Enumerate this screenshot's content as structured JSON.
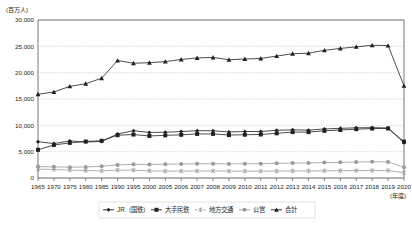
{
  "chart_data": {
    "type": "line",
    "title": "",
    "ylabel": "(百万人)",
    "xlabel": "(年度)",
    "ylim": [
      0,
      30000
    ],
    "yticks": [
      "0",
      "5,000",
      "10,000",
      "15,000",
      "20,000",
      "25,000",
      "30,000"
    ],
    "ytick_values": [
      0,
      5000,
      10000,
      15000,
      20000,
      25000,
      30000
    ],
    "grid": true,
    "legend_position": "bottom",
    "categories": [
      "1965",
      "1970",
      "1975",
      "1980",
      "1985",
      "1990",
      "1995",
      "2000",
      "2005",
      "2006",
      "2007",
      "2008",
      "2009",
      "2010",
      "2011",
      "2012",
      "2013",
      "2014",
      "2015",
      "2016",
      "2017",
      "2018",
      "2019",
      "2020"
    ],
    "series": [
      {
        "name": "JR（国鉄）",
        "marker": "diamond",
        "color": "#231f20",
        "values": [
          6900,
          6534,
          7048,
          6825,
          6941,
          8358,
          8982,
          8654,
          8683,
          8817,
          8988,
          8977,
          8735,
          8818,
          8829,
          9060,
          9147,
          9088,
          9309,
          9429,
          9525,
          9557,
          9504,
          6680
        ]
      },
      {
        "name": "大手民鉄",
        "marker": "square",
        "color": "#231f20",
        "values": [
          5350,
          6270,
          6670,
          6931,
          7070,
          8129,
          8251,
          7989,
          8097,
          8201,
          8366,
          8369,
          8158,
          8219,
          8268,
          8484,
          8714,
          8717,
          8959,
          9117,
          9262,
          9389,
          9396,
          6900
        ]
      },
      {
        "name": "地方交通",
        "marker": "asterisk",
        "color": "#9a9a9a",
        "values": [
          1680,
          1620,
          1500,
          1420,
          1350,
          1500,
          1480,
          1360,
          1300,
          1310,
          1330,
          1340,
          1300,
          1300,
          1300,
          1320,
          1340,
          1340,
          1370,
          1390,
          1410,
          1430,
          1420,
          1000
        ]
      },
      {
        "name": "公営",
        "marker": "circle",
        "color": "#9a9a9a",
        "values": [
          2160,
          2120,
          2050,
          2100,
          2230,
          2480,
          2590,
          2560,
          2620,
          2660,
          2700,
          2710,
          2680,
          2700,
          2720,
          2780,
          2840,
          2860,
          2920,
          2980,
          3020,
          3090,
          3060,
          2050
        ]
      },
      {
        "name": "合計",
        "marker": "triangle",
        "color": "#231f20",
        "values": [
          15900,
          16330,
          17400,
          17900,
          18950,
          22300,
          21790,
          21900,
          22100,
          22500,
          22800,
          22900,
          22450,
          22600,
          22700,
          23150,
          23600,
          23700,
          24250,
          24600,
          24900,
          25200,
          25150,
          17500
        ]
      }
    ]
  }
}
